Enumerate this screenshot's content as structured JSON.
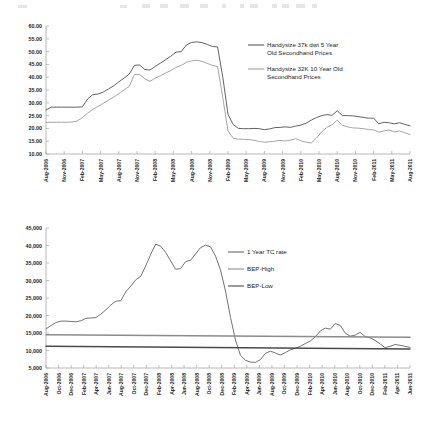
{
  "document": {
    "title": "Handysize Secondhand Prices and 1 Year TC Rate"
  },
  "toolbar": {
    "visible_fragment": true,
    "note": "partial cut-off application toolbar strip at top edge"
  },
  "chart_data": [
    {
      "id": "handysize-secondhand-prices",
      "type": "line",
      "title": "",
      "xlabel": "",
      "ylabel": "",
      "ylim": [
        10.0,
        60.0
      ],
      "ytick_step": 5.0,
      "ytick_labels": [
        "10.00",
        "15.00",
        "20.00",
        "25.00",
        "30.00",
        "35.00",
        "40.00",
        "45.00",
        "50.00",
        "55.00",
        "60.00"
      ],
      "grid": false,
      "legend_position": "upper-right",
      "x_tick_labels": [
        "Aug-2006",
        "Nov-2006",
        "Feb-2007",
        "May-2007",
        "Aug-2007",
        "Nov-2007",
        "Feb-2008",
        "May-2008",
        "Aug-2008",
        "Nov-2008",
        "Feb-2009",
        "May-2009",
        "Aug-2009",
        "Nov-2009",
        "Feb-2010",
        "May-2010",
        "Aug-2010",
        "Nov-2010",
        "Feb-2011",
        "May-2011",
        "Aug-2011"
      ],
      "x_start": "Aug-2006",
      "x_end": "Aug-2011",
      "x_point_count": 61,
      "series": [
        {
          "name": "Handysize 37k dwt 5 Year Old Secondhand Prices",
          "color": "#5a5a5a",
          "values": [
            27.2,
            28.3,
            28.3,
            28.3,
            28.3,
            28.3,
            28.3,
            28.4,
            31.5,
            33.2,
            33.4,
            34.2,
            35.4,
            36.6,
            38.2,
            39.6,
            41.2,
            44.6,
            44.8,
            43.0,
            42.8,
            44.2,
            45.5,
            46.8,
            48.2,
            49.8,
            50.0,
            52.6,
            53.6,
            53.8,
            53.5,
            52.8,
            52.0,
            51.8,
            40.0,
            25.5,
            21.5,
            20.0,
            19.9,
            19.9,
            20.0,
            19.9,
            19.5,
            19.8,
            20.3,
            20.4,
            20.6,
            20.4,
            20.9,
            21.3,
            22.0,
            23.2,
            24.2,
            25.0,
            25.4,
            25.1,
            26.9,
            25.0,
            25.0,
            24.9,
            24.6,
            24.3,
            24.0,
            24.0,
            21.8,
            22.4,
            22.2,
            21.8,
            22.2,
            21.6,
            21.0
          ]
        },
        {
          "name": "Handysize 32K 10 Year Old Secondhand Prices",
          "color": "#a0a0a0",
          "values": [
            22.3,
            22.4,
            22.4,
            22.4,
            22.4,
            22.5,
            22.9,
            24.2,
            26.0,
            27.4,
            28.6,
            29.8,
            31.0,
            32.2,
            33.6,
            35.0,
            36.4,
            41.0,
            41.1,
            39.4,
            38.4,
            39.6,
            40.6,
            41.6,
            42.6,
            43.8,
            44.6,
            45.8,
            46.4,
            46.6,
            46.2,
            45.4,
            44.6,
            44.2,
            32.0,
            19.0,
            16.2,
            15.8,
            15.7,
            15.6,
            15.4,
            14.9,
            14.6,
            14.8,
            15.0,
            15.3,
            15.1,
            15.4,
            16.0,
            15.2,
            14.6,
            14.3,
            16.2,
            18.6,
            20.4,
            21.4,
            23.2,
            21.2,
            20.6,
            20.2,
            20.1,
            19.9,
            19.6,
            19.4,
            18.6,
            19.0,
            19.4,
            18.6,
            19.0,
            18.3,
            17.6
          ]
        }
      ]
    },
    {
      "id": "one-year-tc-rate-vs-bep",
      "type": "line",
      "title": "",
      "xlabel": "",
      "ylabel": "",
      "ylim": [
        5000,
        45000
      ],
      "ytick_step": 5000,
      "ytick_labels": [
        "5,000",
        "10,000",
        "15,000",
        "20,000",
        "25,000",
        "30,000",
        "35,000",
        "40,000",
        "45,000"
      ],
      "grid": false,
      "legend_position": "upper-right",
      "x_tick_labels": [
        "Aug-2006",
        "Oct-2006",
        "Dec-2006",
        "Feb-2007",
        "Apr-2007",
        "Jun-2007",
        "Aug-2007",
        "Oct-2007",
        "Dec-2007",
        "Feb-2008",
        "Apr-2008",
        "Jun-2008",
        "Aug-2008",
        "Oct-2008",
        "Dec-2008",
        "Feb-2009",
        "Apr-2009",
        "Jun-2009",
        "Aug-2009",
        "Oct-2009",
        "Dec-2009",
        "Feb-2010",
        "Apr-2010",
        "Jun-2010",
        "Aug-2010",
        "Oct-2010",
        "Dec-2010",
        "Feb-2011",
        "Apr-2011",
        "Jun-2011"
      ],
      "x_start": "Aug-2006",
      "x_end": "Jun-2011",
      "x_point_count": 59,
      "series": [
        {
          "name": "1 Year TC rate",
          "color": "#6b6b6b",
          "values": [
            16200,
            17100,
            18000,
            18400,
            18400,
            18300,
            18200,
            18500,
            19200,
            19300,
            19400,
            20400,
            21600,
            23000,
            24100,
            24200,
            26800,
            28400,
            30200,
            31200,
            34200,
            37500,
            40400,
            39800,
            38000,
            35600,
            33200,
            33400,
            35400,
            35800,
            37600,
            39400,
            40100,
            39600,
            37000,
            33000,
            27000,
            19500,
            13000,
            8600,
            7200,
            6700,
            6600,
            7400,
            9200,
            9800,
            9300,
            8700,
            9400,
            10200,
            10600,
            11200,
            12000,
            12700,
            13900,
            15600,
            16400,
            16100,
            17700,
            17200,
            15000,
            14100,
            14400,
            15200,
            14000,
            13600,
            12900,
            11900,
            10800,
            11200,
            11700,
            11500,
            11200,
            10900
          ]
        },
        {
          "name": "BEP-High",
          "color": "#8c8c8c",
          "values": [
            14500,
            13800
          ],
          "is_reference_line": true,
          "start_value": 14500,
          "end_value": 13800
        },
        {
          "name": "BEP-Low",
          "color": "#4a4a4a",
          "values": [
            11200,
            10400
          ],
          "is_reference_line": true,
          "start_value": 11200,
          "end_value": 10400
        }
      ]
    }
  ]
}
